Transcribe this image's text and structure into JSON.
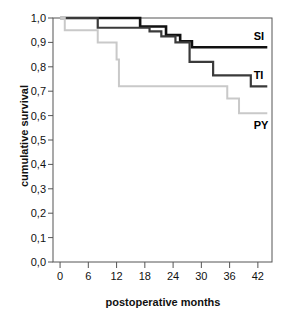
{
  "chart_data": {
    "type": "line",
    "subtype": "kaplan-meier-step",
    "title": "",
    "xlabel": "postoperative months",
    "ylabel": "cumulative survival",
    "xlim": [
      -1.5,
      45
    ],
    "ylim": [
      0.0,
      1.0
    ],
    "grid": false,
    "legend_position": "inline-right",
    "decimal_separator": ",",
    "xticks": [
      0,
      6,
      12,
      18,
      24,
      30,
      36,
      42
    ],
    "xtick_labels": [
      "0",
      "6",
      "12",
      "18",
      "24",
      "30",
      "36",
      "42"
    ],
    "yticks": [
      0.0,
      0.1,
      0.2,
      0.3,
      0.4,
      0.5,
      0.6,
      0.7,
      0.8,
      0.9,
      1.0
    ],
    "ytick_labels": [
      "0,0",
      "0,1",
      "0,2",
      "0,3",
      "0,4",
      "0,5",
      "0,6",
      "0,7",
      "0,8",
      "0,9",
      "1,0"
    ],
    "series": [
      {
        "name": "SI",
        "label": "SI",
        "color": "#111111",
        "width": 2.6,
        "final_value": 0.88,
        "x": [
          0,
          17,
          17,
          22.5,
          22.5,
          25.5,
          25.5,
          28,
          28,
          44
        ],
        "y": [
          1.0,
          1.0,
          0.965,
          0.965,
          0.93,
          0.93,
          0.905,
          0.905,
          0.88,
          0.88
        ],
        "steps": [
          {
            "month": 0,
            "survival": 1.0
          },
          {
            "month": 17,
            "survival": 0.965
          },
          {
            "month": 22.5,
            "survival": 0.93
          },
          {
            "month": 25.5,
            "survival": 0.905
          },
          {
            "month": 28,
            "survival": 0.88
          },
          {
            "month": 44,
            "survival": 0.88
          }
        ]
      },
      {
        "name": "TI",
        "label": "TI",
        "color": "#3a3a3a",
        "width": 2.2,
        "final_value": 0.72,
        "x": [
          0,
          8,
          8,
          19,
          19,
          21.5,
          21.5,
          24.5,
          24.5,
          27.5,
          27.5,
          32.5,
          32.5,
          40.5,
          40.5,
          44
        ],
        "y": [
          1.0,
          1.0,
          0.96,
          0.96,
          0.945,
          0.945,
          0.925,
          0.925,
          0.9,
          0.9,
          0.82,
          0.82,
          0.765,
          0.765,
          0.72,
          0.72
        ],
        "steps": [
          {
            "month": 0,
            "survival": 1.0
          },
          {
            "month": 8,
            "survival": 0.96
          },
          {
            "month": 19,
            "survival": 0.945
          },
          {
            "month": 21.5,
            "survival": 0.925
          },
          {
            "month": 24.5,
            "survival": 0.9
          },
          {
            "month": 27.5,
            "survival": 0.82
          },
          {
            "month": 32.5,
            "survival": 0.765
          },
          {
            "month": 40.5,
            "survival": 0.72
          },
          {
            "month": 44,
            "survival": 0.72
          }
        ]
      },
      {
        "name": "PY",
        "label": "PY",
        "color": "#c9c9c9",
        "width": 2.0,
        "final_value": 0.61,
        "x": [
          0,
          1,
          1,
          8,
          8,
          12,
          12,
          12.5,
          12.5,
          35.5,
          35.5,
          38,
          38,
          44
        ],
        "y": [
          1.0,
          1.0,
          0.95,
          0.95,
          0.9,
          0.9,
          0.83,
          0.83,
          0.72,
          0.72,
          0.67,
          0.67,
          0.61,
          0.61
        ],
        "steps": [
          {
            "month": 0,
            "survival": 1.0
          },
          {
            "month": 1,
            "survival": 0.95
          },
          {
            "month": 8,
            "survival": 0.9
          },
          {
            "month": 12,
            "survival": 0.83
          },
          {
            "month": 12.5,
            "survival": 0.72
          },
          {
            "month": 35.5,
            "survival": 0.67
          },
          {
            "month": 38,
            "survival": 0.61
          },
          {
            "month": 44,
            "survival": 0.61
          }
        ]
      }
    ],
    "series_labels": [
      {
        "text": "SI",
        "month": 44.5,
        "survival": 0.925
      },
      {
        "text": "TI",
        "month": 44.5,
        "survival": 0.765
      },
      {
        "text": "PY",
        "month": 44.5,
        "survival": 0.56
      }
    ]
  },
  "axes": {
    "frame_color": "#555555",
    "background": "#ffffff"
  }
}
